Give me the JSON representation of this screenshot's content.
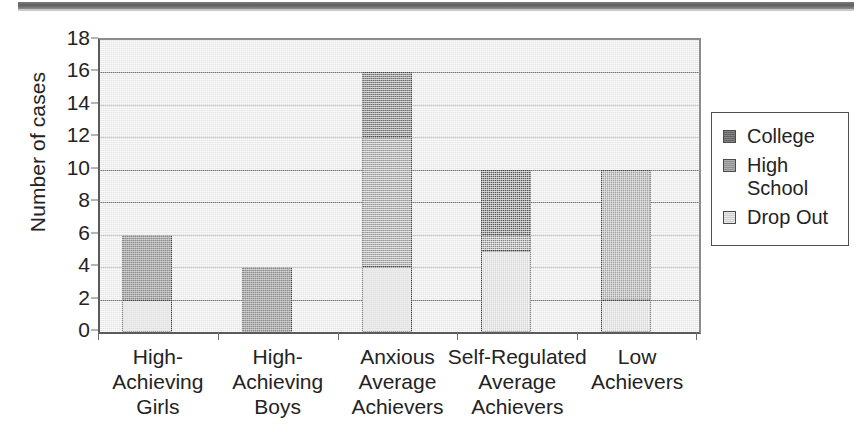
{
  "chart_data": {
    "type": "bar",
    "subtype": "stacked-vertical",
    "title": "",
    "xlabel": "",
    "ylabel": "Number of cases",
    "ylim": [
      0,
      18
    ],
    "ytick_step": 2,
    "yticks": [
      "0",
      "2",
      "4",
      "6",
      "8",
      "10",
      "12",
      "14",
      "16",
      "18"
    ],
    "grid": "horizontal",
    "legend_position": "right",
    "categories": [
      "High-\nAchieving\nGirls",
      "High-\nAchieving\nBoys",
      "Anxious\nAverage\nAchievers",
      "Self-Regulated\nAverage\nAchievers",
      "Low\nAchievers"
    ],
    "category_lines": [
      [
        "High-",
        "Achieving",
        "Girls"
      ],
      [
        "High-",
        "Achieving",
        "Boys"
      ],
      [
        "Anxious",
        "Average",
        "Achievers"
      ],
      [
        "Self-Regulated",
        "Average",
        "Achievers"
      ],
      [
        "Low",
        "Achievers"
      ]
    ],
    "series": [
      {
        "name": "Drop Out",
        "color": "#e2e2e2",
        "values": [
          2,
          0,
          4,
          5,
          2
        ]
      },
      {
        "name": "High School",
        "color": "#9d9d9d",
        "values": [
          0,
          0,
          8,
          1,
          8
        ]
      },
      {
        "name": "College",
        "color": "#6a6a6a",
        "values": [
          4,
          4,
          4,
          4,
          0
        ]
      }
    ],
    "stack_order_bottom_to_top": [
      "Drop Out",
      "High School",
      "College"
    ],
    "totals": [
      6,
      4,
      16,
      10,
      10
    ]
  },
  "legend": {
    "items": [
      {
        "label_lines": [
          "College"
        ],
        "color": "#6a6a6a"
      },
      {
        "label_lines": [
          "High",
          "School"
        ],
        "color": "#9d9d9d"
      },
      {
        "label_lines": [
          "Drop Out"
        ],
        "color": "#e2e2e2"
      }
    ]
  },
  "axis": {
    "y_title": "Number of cases"
  },
  "colors": {
    "plot_background": "#ededed",
    "gridline": "#7d7d7d",
    "axis": "#5a5a5a",
    "bar_outline": "#4b4b4b",
    "text": "#232323"
  }
}
